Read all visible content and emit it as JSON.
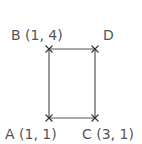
{
  "diagram": {
    "type": "rectangle-on-coordinate-points",
    "colors": {
      "background": "#ffffff",
      "line": "#555555",
      "marker": "#333333",
      "text": "#555555"
    },
    "points": [
      {
        "id": "A",
        "label": "A (1, 1)",
        "px": 49,
        "py": 118,
        "lx": 5,
        "ly": 139
      },
      {
        "id": "B",
        "label": "B (1, 4)",
        "px": 49,
        "py": 49,
        "lx": 11,
        "ly": 40
      },
      {
        "id": "C",
        "label": "C (3, 1)",
        "px": 95,
        "py": 118,
        "lx": 82,
        "ly": 139
      },
      {
        "id": "D",
        "label": "D",
        "px": 95,
        "py": 49,
        "lx": 103,
        "ly": 40
      }
    ],
    "edges": [
      [
        "B",
        "D"
      ],
      [
        "D",
        "C"
      ],
      [
        "C",
        "A"
      ],
      [
        "A",
        "B"
      ]
    ]
  }
}
